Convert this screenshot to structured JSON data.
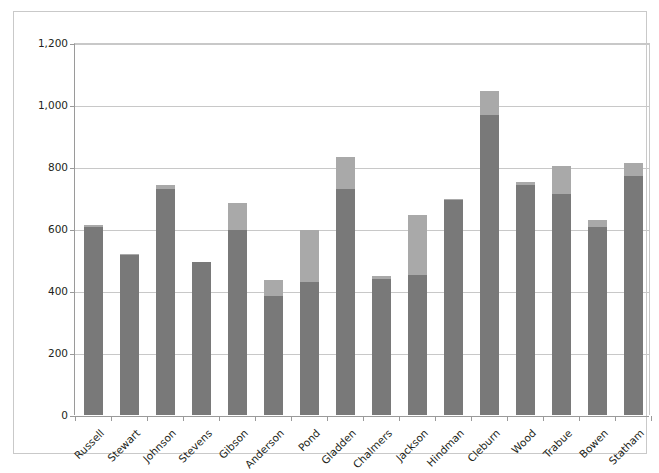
{
  "chart_data": {
    "type": "bar",
    "stacked": true,
    "title": "",
    "subtitle": "",
    "xlabel": "",
    "ylabel": "",
    "ylim": [
      0,
      1200
    ],
    "yticks": [
      0,
      200,
      400,
      600,
      800,
      1000,
      1200
    ],
    "ytick_labels": [
      "0",
      "200",
      "400",
      "600",
      "800",
      "1,000",
      "1,200"
    ],
    "grid": true,
    "legend": "none",
    "categories": [
      "Russell",
      "Stewart",
      "Johnson",
      "Stevens",
      "Gibson",
      "Anderson",
      "Pond",
      "Gladden",
      "Chalmers",
      "Jackson",
      "Hindman",
      "Cleburn",
      "Wood",
      "Trabue",
      "Bowen",
      "Statham"
    ],
    "series": [
      {
        "name": "Series 1",
        "color": "#797979",
        "values": [
          608,
          516,
          730,
          492,
          596,
          385,
          430,
          730,
          440,
          452,
          693,
          968,
          742,
          713,
          608,
          770
        ]
      },
      {
        "name": "Series 2",
        "color": "#a9a9a9",
        "values": [
          4,
          2,
          12,
          2,
          88,
          50,
          167,
          102,
          7,
          193,
          4,
          77,
          10,
          90,
          20,
          42
        ]
      }
    ],
    "totals": [
      612,
      518,
      742,
      494,
      684,
      435,
      597,
      832,
      447,
      645,
      697,
      1045,
      752,
      803,
      628,
      812
    ]
  },
  "colors": {
    "series_dark": "#797979",
    "series_light": "#a9a9a9",
    "gridline": "#c8c8c8",
    "axis": "#9a9a9a",
    "text": "#231f20",
    "border": "#c9c9c9",
    "background": "#ffffff"
  }
}
